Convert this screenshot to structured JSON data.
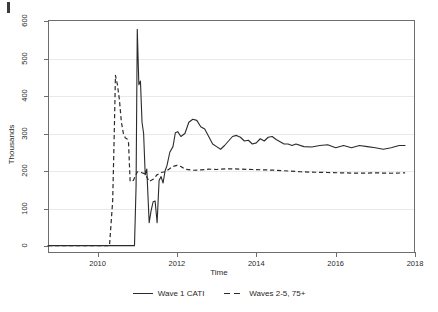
{
  "figure": {
    "background": "#ffffff",
    "ink_color": "#2b2b2b",
    "grid_color": "#e9e9e9",
    "axis_color": "#6d6d6d"
  },
  "axis_titles": {
    "x": "Time",
    "y": "Thousands"
  },
  "chart_data": {
    "type": "line",
    "title": "",
    "xlabel": "Time",
    "ylabel": "Thousands",
    "xlim": [
      2008.75,
      2018.0
    ],
    "ylim": [
      0,
      600
    ],
    "grid": true,
    "legend_position": "bottom",
    "xticks": [
      2010,
      2012,
      2014,
      2016,
      2018
    ],
    "xticklabels": [
      "2010",
      "2012",
      "2014",
      "2016",
      "2018"
    ],
    "yticks": [
      0,
      100,
      200,
      300,
      400,
      500,
      600
    ],
    "yticklabels": [
      "0",
      "100",
      "200",
      "300",
      "400",
      "500",
      "600"
    ],
    "series": [
      {
        "name": "Wave 1 CATI",
        "style": "solid",
        "color": "#2b2b2b",
        "x": [
          2008.75,
          2009.0,
          2009.25,
          2009.5,
          2009.75,
          2010.0,
          2010.25,
          2010.5,
          2010.75,
          2010.82,
          2010.88,
          2010.93,
          2010.97,
          2011.0,
          2011.04,
          2011.08,
          2011.12,
          2011.16,
          2011.2,
          2011.24,
          2011.3,
          2011.35,
          2011.4,
          2011.45,
          2011.5,
          2011.55,
          2011.6,
          2011.65,
          2011.7,
          2011.75,
          2011.82,
          2011.9,
          2011.96,
          2012.02,
          2012.1,
          2012.2,
          2012.3,
          2012.4,
          2012.5,
          2012.6,
          2012.7,
          2012.8,
          2012.9,
          2013.0,
          2013.1,
          2013.2,
          2013.3,
          2013.4,
          2013.5,
          2013.6,
          2013.7,
          2013.8,
          2013.9,
          2014.0,
          2014.1,
          2014.2,
          2014.3,
          2014.4,
          2014.5,
          2014.6,
          2014.7,
          2014.8,
          2014.9,
          2015.0,
          2015.2,
          2015.4,
          2015.6,
          2015.8,
          2016.0,
          2016.2,
          2016.4,
          2016.6,
          2016.8,
          2017.0,
          2017.2,
          2017.4,
          2017.6,
          2017.75
        ],
        "y": [
          1,
          1,
          1,
          1,
          1,
          1,
          1,
          1,
          1,
          1,
          1,
          1,
          160,
          578,
          430,
          440,
          330,
          300,
          190,
          205,
          62,
          95,
          118,
          120,
          62,
          175,
          185,
          168,
          200,
          215,
          250,
          265,
          302,
          305,
          292,
          300,
          330,
          338,
          335,
          318,
          312,
          292,
          272,
          265,
          258,
          268,
          280,
          292,
          295,
          290,
          280,
          282,
          272,
          275,
          286,
          280,
          290,
          292,
          284,
          278,
          272,
          272,
          268,
          272,
          265,
          264,
          268,
          270,
          262,
          268,
          262,
          268,
          265,
          262,
          258,
          262,
          268,
          268
        ]
      },
      {
        "name": "Waves 2-5, 75+",
        "style": "dashed",
        "color": "#2b2b2b",
        "x": [
          2008.75,
          2009.5,
          2010.0,
          2010.3,
          2010.38,
          2010.42,
          2010.45,
          2010.5,
          2010.55,
          2010.6,
          2010.65,
          2010.7,
          2010.74,
          2010.78,
          2010.82,
          2010.9,
          2011.0,
          2011.1,
          2011.2,
          2011.3,
          2011.4,
          2011.5,
          2011.6,
          2011.7,
          2011.8,
          2011.9,
          2012.0,
          2012.1,
          2012.2,
          2012.4,
          2012.6,
          2012.8,
          2013.0,
          2013.3,
          2013.6,
          2013.9,
          2014.2,
          2014.5,
          2014.8,
          2015.1,
          2015.4,
          2015.8,
          2016.2,
          2016.6,
          2017.0,
          2017.4,
          2017.75
        ],
        "y": [
          1,
          1,
          1,
          1,
          120,
          300,
          455,
          430,
          390,
          330,
          300,
          288,
          286,
          275,
          172,
          175,
          198,
          196,
          192,
          172,
          178,
          190,
          196,
          198,
          205,
          212,
          215,
          212,
          205,
          202,
          203,
          205,
          204,
          206,
          205,
          204,
          203,
          202,
          200,
          198,
          197,
          196,
          195,
          194,
          195,
          194,
          195
        ]
      }
    ]
  },
  "legend": {
    "items": [
      {
        "label": "Wave 1 CATI",
        "style": "solid"
      },
      {
        "label": "Waves 2-5, 75+",
        "style": "dashed"
      }
    ]
  }
}
